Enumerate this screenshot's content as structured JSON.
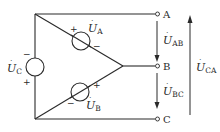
{
  "diagram": {
    "type": "circuit",
    "colors": {
      "line": "#2a2a2a",
      "background": "#ffffff"
    },
    "terminals": [
      {
        "id": "A",
        "label": "A"
      },
      {
        "id": "B",
        "label": "B"
      },
      {
        "id": "C",
        "label": "C"
      }
    ],
    "sources": [
      {
        "id": "UA",
        "symbol": "U",
        "subscript": "A",
        "plus": "+",
        "minus": "−"
      },
      {
        "id": "UB",
        "symbol": "U",
        "subscript": "B",
        "plus": "+",
        "minus": "−"
      },
      {
        "id": "UC",
        "symbol": "U",
        "subscript": "C",
        "plus": "+",
        "minus": "−"
      }
    ],
    "voltages": [
      {
        "id": "UAB",
        "symbol": "U",
        "subscript": "AB",
        "direction": "down"
      },
      {
        "id": "UBC",
        "symbol": "U",
        "subscript": "BC",
        "direction": "down"
      },
      {
        "id": "UCA",
        "symbol": "U",
        "subscript": "CA",
        "direction": "up"
      }
    ],
    "dot_mark": "·"
  }
}
